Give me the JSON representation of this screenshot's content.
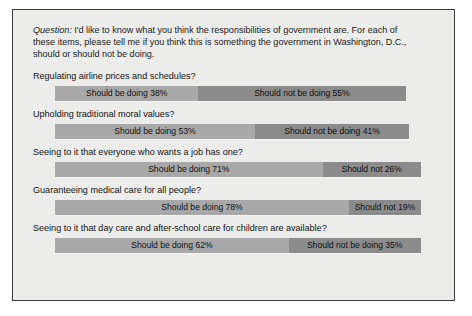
{
  "figure": {
    "question_label": "Question:",
    "question_text": " I'd like to know what you think the responsibilities of government are. For each of these items, please tell me if you think this is something the government in Washington, D.C., should or should not be doing."
  },
  "colors": {
    "should_be_doing": "#a8a8a8",
    "should_not_be_doing": "#8b8b8b",
    "panel_background": "#ececea",
    "panel_border": "#3b3b3b",
    "text": "#111111"
  },
  "chart_data": {
    "type": "bar",
    "orientation": "horizontal",
    "stacked": true,
    "title": "",
    "subtitle": "",
    "xlabel": "",
    "ylabel": "",
    "grid": false,
    "legend_position": "none",
    "categories": [
      "Regulating airline prices and schedules?",
      "Upholding traditional moral values?",
      "Seeing to it that everyone who wants a job has one?",
      "Guaranteeing medical care for all people?",
      "Seeing to it that day care and after-school care for children are available?"
    ],
    "series": [
      {
        "name": "Should be doing",
        "values": [
          38,
          53,
          71,
          78,
          62
        ]
      },
      {
        "name": "Should not be doing",
        "values": [
          55,
          41,
          26,
          19,
          35
        ]
      }
    ],
    "rows": [
      {
        "label": "Regulating airline prices and schedules?",
        "positive_label": "Should be doing 38%",
        "positive_value": 38,
        "negative_label": "Should not be doing 55%",
        "negative_value": 55
      },
      {
        "label": "Upholding traditional moral values?",
        "positive_label": "Should be doing 53%",
        "positive_value": 53,
        "negative_label": "Should not be doing 41%",
        "negative_value": 41
      },
      {
        "label": "Seeing to it that everyone who wants a job has one?",
        "positive_label": "Should be doing 71%",
        "positive_value": 71,
        "negative_label": "Should not 26%",
        "negative_value": 26
      },
      {
        "label": "Guaranteeing medical care for all people?",
        "positive_label": "Should be doing 78%",
        "positive_value": 78,
        "negative_label": "Should not 19%",
        "negative_value": 19
      },
      {
        "label": "Seeing to it that day care and after-school care for children are available?",
        "positive_label": "Should be doing 62%",
        "positive_value": 62,
        "negative_label": "Should not be doing 35%",
        "negative_value": 35
      }
    ]
  }
}
